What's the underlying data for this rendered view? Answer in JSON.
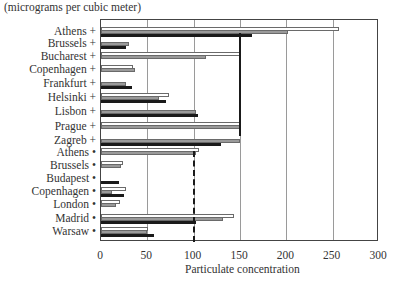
{
  "chart_data": {
    "type": "bar",
    "orientation": "horizontal",
    "title": "",
    "unit_label": "(micrograms per cubic meter)",
    "xlabel": "Particulate concentration",
    "ylabel": "",
    "xlim": [
      0,
      300
    ],
    "x_ticks": [
      0,
      50,
      100,
      150,
      200,
      250,
      300
    ],
    "grid": "vertical",
    "legend": "none visible",
    "categories": [
      "Athens +",
      "Brussels +",
      "Bucharest +",
      "Copenhagen +",
      "Frankfurt +",
      "Helsinki +",
      "Lisbon +",
      "Prague +",
      "Zagreb +",
      "Athens •",
      "Brussels •",
      "Budapest •",
      "Copenhagen •",
      "London •",
      "Madrid •",
      "Warsaw •"
    ],
    "series": [
      {
        "name": "Series 1 (white)",
        "color": "#ffffff",
        "values": [
          257,
          null,
          150,
          34,
          null,
          73,
          null,
          150,
          null,
          106,
          24,
          null,
          27,
          20,
          144,
          51
        ]
      },
      {
        "name": "Series 2 (grey)",
        "color": "#9a9a9a",
        "values": [
          202,
          30,
          113,
          37,
          27,
          63,
          103,
          150,
          150,
          103,
          22,
          null,
          12,
          16,
          132,
          50
        ]
      },
      {
        "name": "Series 3 (black)",
        "color": "#1a1a1a",
        "values": [
          163,
          27,
          null,
          null,
          33,
          70,
          105,
          null,
          130,
          null,
          null,
          19,
          25,
          null,
          102,
          57
        ]
      }
    ],
    "reference_lines": [
      {
        "value": 150,
        "style": "solid",
        "applies_to": "Athens + to Prague +"
      },
      {
        "value": 100,
        "style": "dashed",
        "applies_to": "Athens • to Warsaw •"
      }
    ]
  }
}
